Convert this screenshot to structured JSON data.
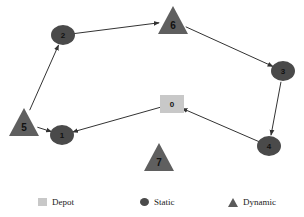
{
  "diagram": {
    "type": "directed-route-graph",
    "nodes": [
      {
        "id": "0",
        "label": "0",
        "kind": "depot",
        "x": 172,
        "y": 104
      },
      {
        "id": "1",
        "label": "1",
        "kind": "static",
        "x": 62,
        "y": 135
      },
      {
        "id": "2",
        "label": "2",
        "kind": "static",
        "x": 63,
        "y": 35
      },
      {
        "id": "3",
        "label": "3",
        "kind": "static",
        "x": 283,
        "y": 71
      },
      {
        "id": "4",
        "label": "4",
        "kind": "static",
        "x": 269,
        "y": 146
      },
      {
        "id": "5",
        "label": "5",
        "kind": "dynamic",
        "x": 24,
        "y": 123
      },
      {
        "id": "6",
        "label": "6",
        "kind": "dynamic",
        "x": 173,
        "y": 21
      },
      {
        "id": "7",
        "label": "7",
        "kind": "dynamic",
        "x": 159,
        "y": 158
      }
    ],
    "edges": [
      {
        "from": "2",
        "to": "6"
      },
      {
        "from": "6",
        "to": "3"
      },
      {
        "from": "3",
        "to": "4"
      },
      {
        "from": "4",
        "to": "0"
      },
      {
        "from": "0",
        "to": "1"
      },
      {
        "from": "5",
        "to": "1"
      },
      {
        "from": "5",
        "to": "2"
      }
    ]
  },
  "legend": {
    "items": [
      {
        "label": "Depot",
        "shape": "square",
        "color": "#c8c8c8"
      },
      {
        "label": "Static",
        "shape": "circle",
        "color": "#4a4a4a"
      },
      {
        "label": "Dynamic",
        "shape": "triangle",
        "color": "#5a5a5a"
      }
    ]
  },
  "colors": {
    "depot": "#c8c8c8",
    "static": "#4a4a4a",
    "dynamic": "#5f5f5f",
    "edge": "#333333"
  }
}
